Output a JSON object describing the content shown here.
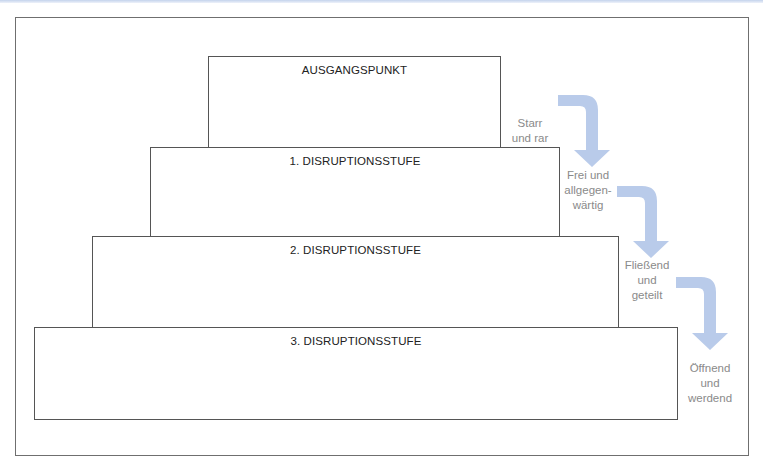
{
  "diagram": {
    "title": "",
    "boxes": [
      {
        "label": "AUSGANGSPUNKT"
      },
      {
        "label": "1. DISRUPTIONSSTUFE"
      },
      {
        "label": "2. DISRUPTIONSSTUFE"
      },
      {
        "label": "3. DISRUPTIONSSTUFE"
      }
    ],
    "steps": [
      {
        "lines": [
          "Starr",
          "und rar"
        ]
      },
      {
        "lines": [
          "Frei und",
          "allgegen-",
          "wärtig"
        ]
      },
      {
        "lines": [
          "Fließend",
          "und",
          "geteilt"
        ]
      },
      {
        "lines": [
          "Öffnend",
          "und",
          "werdend"
        ]
      }
    ],
    "colors": {
      "arrow": "#b9cbea",
      "box_border": "#555555",
      "step_text": "#8a8a8a"
    }
  }
}
